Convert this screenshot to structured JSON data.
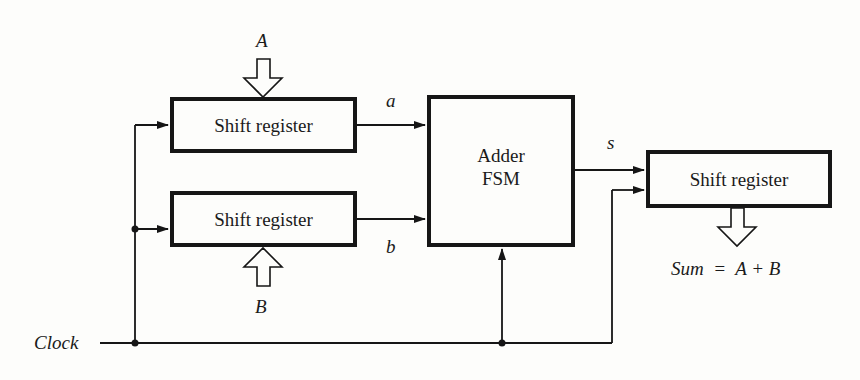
{
  "diagram": {
    "type": "block-diagram",
    "blocks": {
      "shift_register_a": {
        "label": "Shift register"
      },
      "shift_register_b": {
        "label": "Shift register"
      },
      "adder_fsm": {
        "line1": "Adder",
        "line2": "FSM"
      },
      "shift_register_sum": {
        "label": "Shift register"
      }
    },
    "signals": {
      "input_A": "A",
      "input_B": "B",
      "a": "a",
      "b": "b",
      "s": "s",
      "clock": "Clock",
      "sum_output": "Sum  =  A + B"
    },
    "colors": {
      "line": "#161616",
      "background": "#fdfdfb"
    }
  }
}
